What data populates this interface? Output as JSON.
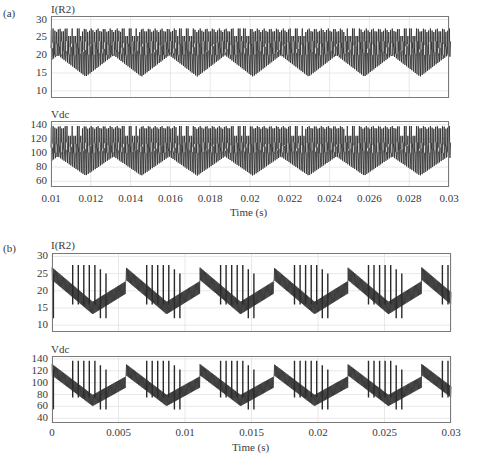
{
  "chart_data": [
    {
      "panel": "(a)",
      "type": "line",
      "xlabel": "Time (s)",
      "xlim": [
        0.01,
        0.03
      ],
      "xticks": [
        "0.01",
        "0.012",
        "0.014",
        "0.016",
        "0.018",
        "0.02",
        "0.022",
        "0.024",
        "0.026",
        "0.028",
        "0.03"
      ],
      "grid": true,
      "subplots": [
        {
          "title": "I(R2)",
          "ylim": [
            8,
            31
          ],
          "yticks": [
            "30",
            "25",
            "20",
            "15",
            "10"
          ],
          "waveform": {
            "period_s": 0.0028,
            "ripple_freq_pulses_per_period": 20,
            "upper_envelope": [
              26.5,
              27.5
            ],
            "lower_envelope_peak": 20,
            "lower_envelope_trough": 14,
            "mid_band": [
              20,
              24
            ]
          },
          "series_color": "#2a2a2a"
        },
        {
          "title": "Vdc",
          "ylim": [
            52,
            145
          ],
          "yticks": [
            "140",
            "120",
            "100",
            "80",
            "60"
          ],
          "waveform": {
            "period_s": 0.0028,
            "ripple_freq_pulses_per_period": 20,
            "upper_envelope": [
              134,
              138
            ],
            "lower_envelope_peak": 95,
            "lower_envelope_trough": 68,
            "mid_band": [
              100,
              115
            ]
          },
          "series_color": "#2a2a2a"
        }
      ]
    },
    {
      "panel": "(b)",
      "type": "line",
      "xlabel": "Time (s)",
      "xlim": [
        0,
        0.03
      ],
      "xticks": [
        "0",
        "0.005",
        "0.01",
        "0.015",
        "0.02",
        "0.025",
        "0.03"
      ],
      "grid": true,
      "subplots": [
        {
          "title": "I(R2)",
          "ylim": [
            8,
            31
          ],
          "yticks": [
            "30",
            "25",
            "20",
            "15",
            "10"
          ],
          "waveform": {
            "period_s": 0.00556,
            "sawtooth_start": 25,
            "sawtooth_end": 15,
            "spike_high": 27.5,
            "spike_low": 12,
            "spikes_per_period": 7
          },
          "series_color": "#2a2a2a"
        },
        {
          "title": "Vdc",
          "ylim": [
            32,
            145
          ],
          "yticks": [
            "140",
            "120",
            "100",
            "80",
            "60",
            "40"
          ],
          "waveform": {
            "period_s": 0.00556,
            "sawtooth_start": 122,
            "sawtooth_end": 70,
            "spike_high": 137,
            "spike_low": 55,
            "spikes_per_period": 7
          },
          "series_color": "#2a2a2a"
        }
      ]
    }
  ],
  "labels": {
    "panel_a": "(a)",
    "panel_b": "(b)",
    "a_top_title": "I(R2)",
    "a_bottom_title": "Vdc",
    "b_top_title": "I(R2)",
    "b_bottom_title": "Vdc",
    "xlabel_a": "Time (s)",
    "xlabel_b": "Time (s)"
  }
}
